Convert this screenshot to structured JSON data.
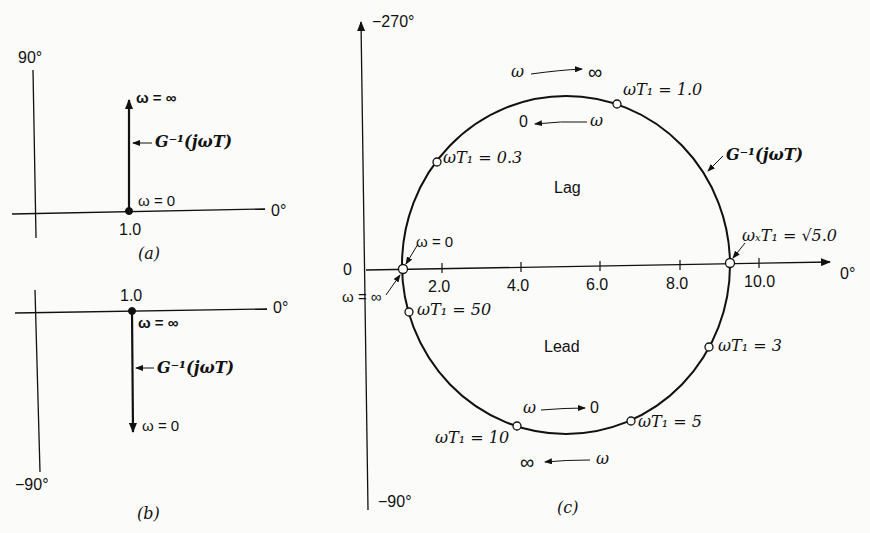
{
  "panels": {
    "a": {
      "caption": "(a)",
      "axis_top_label": "90°",
      "axis_right_label": "0°",
      "point_label": "1.0",
      "start_label": "ω = 0",
      "end_label": "ω = ∞",
      "curve_label": "G⁻¹(jωT)"
    },
    "b": {
      "caption": "(b)",
      "axis_bottom_label": "−90°",
      "axis_right_label": "0°",
      "point_label": "1.0",
      "start_label": "ω = ∞",
      "end_label": "ω = 0",
      "curve_label": "G⁻¹(jωT)"
    },
    "c": {
      "caption": "(c)",
      "axis_top_label": "−270°",
      "axis_bottom_label": "−90°",
      "axis_right_label": "0°",
      "origin_label": "0",
      "ticks": [
        "2.0",
        "4.0",
        "6.0",
        "8.0",
        "10.0"
      ],
      "region_upper": "Lag",
      "region_lower": "Lead",
      "curve_label": "G⁻¹(jωT)",
      "left_point_upper_label": "ω = 0",
      "left_point_lower_label": "ω = ∞",
      "crossover_label": "ωₓT₁ = √5.0",
      "points": [
        {
          "label": "ωT₁ = 1.0"
        },
        {
          "label": "ωT₁ = 0.3"
        },
        {
          "label": "ωT₁ = 50"
        },
        {
          "label": "ωT₁ = 3"
        },
        {
          "label": "ωT₁ = 5"
        },
        {
          "label": "ωT₁ = 10"
        }
      ],
      "direction_notes": {
        "top_outer": {
          "from": "ω",
          "to": "∞"
        },
        "top_inner": {
          "from": "ω",
          "to": "0"
        },
        "bottom_inner": {
          "from": "ω",
          "to": "0"
        },
        "bottom_outer": {
          "from": "ω",
          "to": "∞"
        }
      }
    }
  }
}
